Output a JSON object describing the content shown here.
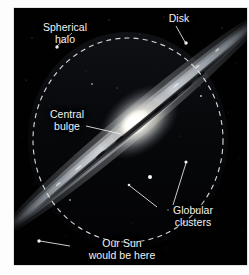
{
  "figure": {
    "credit": "European Southern Observatory",
    "alt_title": "Edge-on spiral galaxy illustrating the structure of the Milky Way",
    "frame": {
      "x": 14,
      "y": 8,
      "width": 233,
      "height": 257,
      "background_color": "#000000"
    }
  },
  "annotations": [
    {
      "id": "spherical-halo",
      "label_line1": "Spherical",
      "label_line2": "halo",
      "label_x": 22,
      "label_y": 22,
      "align": "left",
      "leader": {
        "x1": 72,
        "y1": 33,
        "x2": 57,
        "y2": 46
      },
      "marker": {
        "x": 57,
        "y": 47,
        "r": 1.6
      }
    },
    {
      "id": "disk",
      "label_line1": "Disk",
      "label_line2": "",
      "label_x": 165,
      "label_y": 13,
      "align": "left",
      "leader": {
        "x1": 176,
        "y1": 26,
        "x2": 185,
        "y2": 42
      },
      "marker": {
        "x": 186,
        "y": 43,
        "r": 1.6
      }
    },
    {
      "id": "central-bulge",
      "label_line1": "Central",
      "label_line2": "bulge",
      "label_x": 46,
      "label_y": 111,
      "align": "left",
      "leader": {
        "x1": 86,
        "y1": 126,
        "x2": 121,
        "y2": 134
      },
      "marker": null
    },
    {
      "id": "globular-clusters",
      "label_line1": "Globular",
      "label_line2": "clusters",
      "label_x": 158,
      "label_y": 207,
      "align": "left",
      "leader": {
        "x1": 173,
        "y1": 205,
        "x2": 186,
        "y2": 163
      },
      "leader2": {
        "x1": 157,
        "y1": 207,
        "x2": 130,
        "y2": 186
      },
      "marker": {
        "x": 129,
        "y": 185,
        "r": 1.3
      }
    },
    {
      "id": "our-sun",
      "label_line1": "Our Sun",
      "label_line2": "would be here",
      "label_x": 74,
      "label_y": 240,
      "align": "left",
      "leader": {
        "x1": 70,
        "y1": 246,
        "x2": 40,
        "y2": 241
      },
      "marker": {
        "x": 39,
        "y": 241,
        "r": 1.6
      }
    }
  ],
  "halo_circle": {
    "center_x": 128,
    "center_y": 140,
    "radius_x": 95,
    "radius_y": 102,
    "stroke_color": "#e8e8e8",
    "dash": "5 4",
    "stroke_width": 1.2
  },
  "galaxy": {
    "type": "edge-on spiral",
    "disk_angle_deg": -40,
    "bulge_center_x": 133,
    "bulge_center_y": 124,
    "core_color": "#fffdf2",
    "disk_color": "#b9bfc6",
    "dust_lane_color": "#1a1c20"
  },
  "globular_cluster_dots": [
    {
      "x": 150,
      "y": 177,
      "r": 1.8
    },
    {
      "x": 186,
      "y": 162,
      "r": 1.5
    },
    {
      "x": 129,
      "y": 185,
      "r": 1.2
    },
    {
      "x": 201,
      "y": 96,
      "r": 1.0
    },
    {
      "x": 92,
      "y": 84,
      "r": 0.9
    },
    {
      "x": 57,
      "y": 47,
      "r": 1.4
    },
    {
      "x": 39,
      "y": 241,
      "r": 1.5
    },
    {
      "x": 118,
      "y": 97,
      "r": 0.9
    },
    {
      "x": 168,
      "y": 210,
      "r": 0.8
    },
    {
      "x": 70,
      "y": 200,
      "r": 0.8
    }
  ]
}
